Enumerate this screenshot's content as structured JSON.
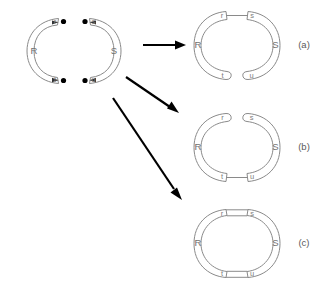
{
  "figure": {
    "stroke_color": "#8a8a8a",
    "arrow_color": "#000000",
    "dot_color": "#000000",
    "label_color": "#7d7d7d",
    "background": "#ffffff"
  },
  "source": {
    "name": "source-pair",
    "left_piece": {
      "label": "R",
      "shape": "open-arc-c",
      "opening": "right",
      "endpoints": [
        {
          "label": "r",
          "position": "top",
          "dot": true,
          "arrow": "clockwise"
        },
        {
          "label": "t",
          "position": "bottom",
          "dot": true,
          "arrow": "counterclockwise"
        }
      ]
    },
    "right_piece": {
      "label": "S",
      "shape": "open-arc-c-reversed",
      "opening": "left",
      "endpoints": [
        {
          "label": "s",
          "position": "top",
          "dot": true,
          "arrow": "counterclockwise"
        },
        {
          "label": "u",
          "position": "bottom",
          "dot": true,
          "arrow": "clockwise"
        }
      ]
    }
  },
  "arrows": [
    {
      "name": "arrow-to-a",
      "from": "source-pair",
      "to": "result-a",
      "direction": "right"
    },
    {
      "name": "arrow-to-b",
      "from": "source-pair",
      "to": "result-b",
      "direction": "down-right"
    },
    {
      "name": "arrow-to-c",
      "from": "source-pair",
      "to": "result-c",
      "direction": "down-right-steep"
    }
  ],
  "results": [
    {
      "id": "a",
      "caption": "(a)",
      "left_label": "R",
      "right_label": "S",
      "top_left_label": "r",
      "top_right_label": "s",
      "bottom_left_label": "t",
      "bottom_right_label": "u",
      "glued_top": true,
      "glued_bottom": false,
      "description": "glued along top endpoints r and s only"
    },
    {
      "id": "b",
      "caption": "(b)",
      "left_label": "R",
      "right_label": "S",
      "top_left_label": "r",
      "top_right_label": "s",
      "bottom_left_label": "t",
      "bottom_right_label": "u",
      "glued_top": false,
      "glued_bottom": true,
      "description": "glued along bottom endpoints t and u only"
    },
    {
      "id": "c",
      "caption": "(c)",
      "left_label": "R",
      "right_label": "S",
      "top_left_label": "r",
      "top_right_label": "s",
      "bottom_left_label": "t",
      "bottom_right_label": "u",
      "glued_top": true,
      "glued_bottom": true,
      "description": "glued along both pairs forming a closed ring"
    }
  ]
}
